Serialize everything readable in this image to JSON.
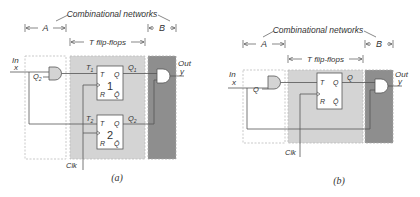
{
  "diagram_a": {
    "header": "Combinational networks",
    "region_a_label": "A",
    "region_b_label": "B",
    "flipflops_label": "T flip-flops",
    "input_label_top": "In",
    "input_label_bottom": "x",
    "output_label_top": "Out",
    "output_label_bottom": "y",
    "gate_a_input": "Q",
    "gate_a_input_sub": "2",
    "ff1": {
      "t_label": "T",
      "t_sub": "1",
      "in": "T",
      "out": "Q",
      "number": "1",
      "reset": "R",
      "qbar": "Q̄",
      "q_label": "Q",
      "q_sub": "1"
    },
    "ff2": {
      "t_label": "T",
      "t_sub": "2",
      "in": "T",
      "out": "Q",
      "number": "2",
      "reset": "R",
      "qbar": "Q̄",
      "q_label": "Q",
      "q_sub": "2"
    },
    "clock_label": "Clk",
    "caption": "(a)"
  },
  "diagram_b": {
    "header": "Combinational networks",
    "region_a_label": "A",
    "region_b_label": "B",
    "flipflops_label": "T flip-flops",
    "input_label_top": "In",
    "input_label_bottom": "x",
    "output_label_top": "Out",
    "output_label_bottom": "y",
    "gate_a_input": "Q",
    "ff": {
      "in": "T",
      "out": "Q",
      "reset": "R",
      "qbar": "Q̄",
      "q_label": "Q"
    },
    "clock_label": "Clk",
    "caption": "(b)"
  },
  "colors": {
    "flipflop_region": "#d4d4d4",
    "output_region": "#8e8e8e",
    "lines": "#555555",
    "dashed_border": "#bbbbbb"
  }
}
